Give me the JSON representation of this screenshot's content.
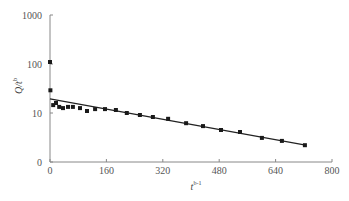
{
  "chart_data": {
    "type": "scatter",
    "title": "",
    "xlabel": "t^(b-1)",
    "xlabel_main": "t",
    "xlabel_sup": "b-1",
    "ylabel": "Q/t^b",
    "ylabel_main": "Q/t",
    "ylabel_sup": "b",
    "yscale": "log",
    "xlim": [
      0,
      800
    ],
    "ylim": [
      1,
      1000
    ],
    "xticks": [
      0,
      160,
      320,
      480,
      640,
      800
    ],
    "xtick_labels": [
      "0",
      "160",
      "320",
      "480",
      "640",
      "800"
    ],
    "yticks": [
      1,
      10,
      100,
      1000
    ],
    "ytick_labels": [
      "0",
      "10",
      "100",
      "1000"
    ],
    "grid": false,
    "legend": null,
    "series": [
      {
        "name": "observed",
        "type": "scatter",
        "marker": "square",
        "color": "#1a1a1a",
        "points": [
          [
            0,
            110
          ],
          [
            1,
            29
          ],
          [
            9,
            14.5
          ],
          [
            17,
            16
          ],
          [
            26,
            13.3
          ],
          [
            37,
            12.6
          ],
          [
            51,
            13.3
          ],
          [
            65,
            13.3
          ],
          [
            85,
            12.6
          ],
          [
            105,
            11
          ],
          [
            128,
            12
          ],
          [
            156,
            12
          ],
          [
            187,
            11.5
          ],
          [
            218,
            10
          ],
          [
            255,
            9.1
          ],
          [
            292,
            8.3
          ],
          [
            335,
            7.6
          ],
          [
            386,
            6.2
          ],
          [
            434,
            5.4
          ],
          [
            485,
            4.5
          ],
          [
            539,
            4.1
          ],
          [
            601,
            3.1
          ],
          [
            658,
            2.7
          ],
          [
            723,
            2.2
          ]
        ]
      },
      {
        "name": "fit",
        "type": "line",
        "color": "#222222",
        "points": [
          [
            0,
            19.5
          ],
          [
            725,
            2.2
          ]
        ]
      }
    ]
  },
  "colors": {
    "axis": "#888888",
    "text": "#555555",
    "marker": "#1a1a1a",
    "line": "#222222"
  }
}
